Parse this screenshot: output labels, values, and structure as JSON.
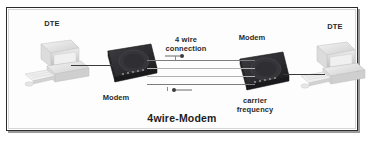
{
  "diagram": {
    "title": "4wire-Modem",
    "type": "network-diagram",
    "labels": {
      "dte_left": "DTE",
      "dte_right": "DTE",
      "modem_left": "Modem",
      "modem_right": "Modem",
      "connection": "4 wire\nconnection",
      "carrier": "carrier\nfrequency"
    },
    "nodes": [
      {
        "id": "dte-left",
        "label": "DTE",
        "kind": "workstation"
      },
      {
        "id": "modem-left",
        "label": "Modem",
        "kind": "modem"
      },
      {
        "id": "modem-right",
        "label": "Modem",
        "kind": "modem"
      },
      {
        "id": "dte-right",
        "label": "DTE",
        "kind": "workstation"
      }
    ],
    "links": [
      {
        "from": "dte-left",
        "to": "modem-left",
        "kind": "serial-cable"
      },
      {
        "from": "modem-left",
        "to": "modem-right",
        "kind": "4-wire-line",
        "wires": 4
      },
      {
        "from": "modem-right",
        "to": "dte-right",
        "kind": "serial-cable"
      }
    ],
    "colors": {
      "frame_border": "#2b2b2b",
      "background": "#ffffff",
      "modem_body": "#2f2f33",
      "dte_body": "#e3e3e3",
      "wire": "#7d7d7d",
      "text": "#2a2a2a"
    }
  }
}
